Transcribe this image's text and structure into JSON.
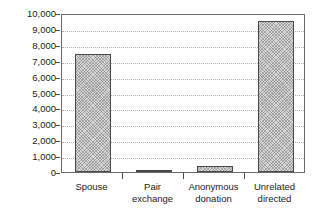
{
  "chart_data": {
    "type": "bar",
    "title": "",
    "subtitle": "",
    "xlabel": "",
    "ylabel": "",
    "categories": [
      "Spouse",
      "Pair exchange",
      "Anonymous donation",
      "Unrelated directed"
    ],
    "category_labels_wrapped": [
      "Spouse",
      "Pair\nexchange",
      "Anonymous\ndonation",
      "Unrelated\ndirected"
    ],
    "values": [
      7400,
      120,
      350,
      9500
    ],
    "ylim": [
      0,
      10000
    ],
    "ytick_values": [
      0,
      1000,
      2000,
      3000,
      4000,
      5000,
      6000,
      7000,
      8000,
      9000,
      10000
    ],
    "ytick_labels": [
      "0",
      "1,000",
      "2,000",
      "3,000",
      "4,000",
      "5,000",
      "6,000",
      "7,000",
      "8,000",
      "9,000",
      "10,000"
    ],
    "grid": true,
    "grid_axis": "y",
    "grid_style": "dotted",
    "legend": false,
    "legend_position": "none",
    "bar_fill": "crosshatch-pattern",
    "bar_edge_color": "#4a4a4a",
    "frame_color": "#6b6b6b",
    "gridline_color": "#b4b4b4",
    "text_color": "#1a1a1a",
    "background_color": "#ffffff"
  }
}
